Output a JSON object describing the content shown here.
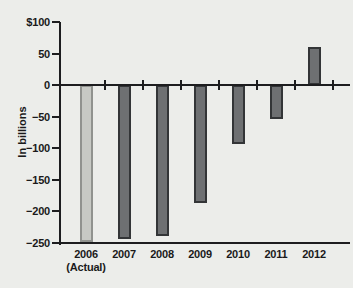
{
  "chart_data": {
    "type": "bar",
    "title": "",
    "xlabel": "",
    "ylabel": "In billions",
    "categories": [
      "2006 (Actual)",
      "2007",
      "2008",
      "2009",
      "2010",
      "2011",
      "2012"
    ],
    "values": [
      -248,
      -244,
      -239,
      -187,
      -94,
      -54,
      61
    ],
    "ylim": [
      -250,
      100
    ],
    "ytick_step": 50,
    "ytick_labels": [
      "$100",
      "50",
      "0",
      "−50",
      "−100",
      "−150",
      "−200",
      "−250"
    ],
    "grid": false,
    "legend": null,
    "bars": [
      {
        "label": "2006",
        "sublabel": "(Actual)",
        "value": -248,
        "role": "actual"
      },
      {
        "label": "2007",
        "sublabel": "",
        "value": -244,
        "role": "projected"
      },
      {
        "label": "2008",
        "sublabel": "",
        "value": -239,
        "role": "projected"
      },
      {
        "label": "2009",
        "sublabel": "",
        "value": -187,
        "role": "projected"
      },
      {
        "label": "2010",
        "sublabel": "",
        "value": -94,
        "role": "projected"
      },
      {
        "label": "2011",
        "sublabel": "",
        "value": -54,
        "role": "projected"
      },
      {
        "label": "2012",
        "sublabel": "",
        "value": 61,
        "role": "projected"
      }
    ],
    "colors": {
      "actual_fill": "#c7c9c4",
      "actual_border": "#90928e",
      "projected_fill": "#6e7072",
      "projected_border": "#333537",
      "axis": "#1d1d1f",
      "text": "#1a1a1a",
      "background": "#ecedea"
    }
  }
}
